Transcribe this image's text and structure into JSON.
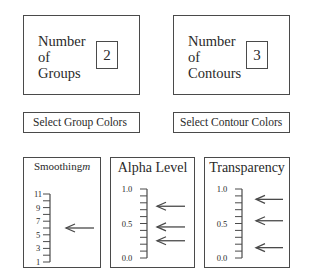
{
  "groups_panel": {
    "label": "Number\nof\nGroups",
    "value": "2"
  },
  "contours_panel": {
    "label": "Number\nof\nContours",
    "value": "3"
  },
  "buttons": {
    "group_colors": "Select Group Colors",
    "contour_colors": "Select Contour Colors"
  },
  "sliders": [
    {
      "title": "Smoothing m",
      "title_main": "Smoothing",
      "title_var": "m",
      "min": 1,
      "max": 11,
      "tick_step": 1,
      "tick_labels": [
        "1",
        "3",
        "5",
        "7",
        "9",
        "11"
      ],
      "tick_label_values": [
        1,
        3,
        5,
        7,
        9,
        11
      ],
      "pointer_values": [
        6
      ]
    },
    {
      "title": "Alpha Level",
      "min": 0.0,
      "max": 1.0,
      "tick_step": 0.1,
      "tick_labels": [
        "0.0",
        "0.5",
        "1.0"
      ],
      "tick_label_values": [
        0.0,
        0.5,
        1.0
      ],
      "pointer_values": [
        0.75,
        0.45,
        0.25
      ]
    },
    {
      "title": "Transparency",
      "min": 0.0,
      "max": 1.0,
      "tick_step": 0.1,
      "tick_labels": [
        "0.0",
        "0.5",
        "1.0"
      ],
      "tick_label_values": [
        0.0,
        0.5,
        1.0
      ],
      "pointer_values": [
        0.85,
        0.54,
        0.15
      ]
    }
  ],
  "colors": {
    "line": "#4a4a4a",
    "text": "#2a2a2a",
    "background": "#ffffff"
  }
}
